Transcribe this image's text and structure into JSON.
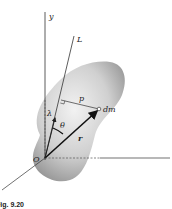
{
  "figure": {
    "caption": "Fig. 9.20",
    "labels": {
      "y_axis": "y",
      "axis_L": "L",
      "distance_p": "p",
      "mass_element": "dm",
      "unit_vector": "λ",
      "angle": "θ",
      "position_vector": "r",
      "origin": "O"
    },
    "colors": {
      "body_fill_light": "#e8e8e8",
      "body_fill_dark": "#9a9a9a",
      "line": "#333333",
      "vector": "#111111"
    }
  }
}
